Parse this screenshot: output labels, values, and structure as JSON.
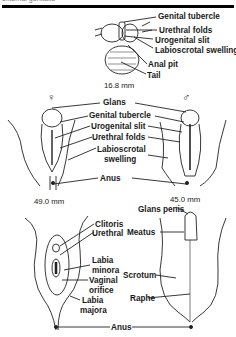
{
  "header": {
    "cropped_text": "external genitalia",
    "rule": true
  },
  "stage1": {
    "measurement": "16.8 mm",
    "labels": [
      "Genital tubercle",
      "Urethral folds",
      "Urogenital slit",
      "Labioscrotal swelling",
      "Anal pit",
      "Tail"
    ]
  },
  "stage2": {
    "female_symbol": "♀",
    "male_symbol": "♂",
    "female_measurement": "49.0 mm",
    "male_measurement": "45.0 mm",
    "labels": [
      "Glans",
      "Genital tubercle",
      "Urogenital slit",
      "Urethral folds",
      "Labioscrotal",
      "swelling",
      "Anus"
    ]
  },
  "stage3": {
    "female_labels": [
      "Clitoris",
      "Urethral",
      "Labia",
      "minora",
      "Vaginal",
      "orifice",
      "Labia",
      "majora"
    ],
    "male_labels": [
      "Glans penis",
      "Meatus",
      "Scrotum",
      "Raphe"
    ],
    "shared_label": "Anus"
  }
}
